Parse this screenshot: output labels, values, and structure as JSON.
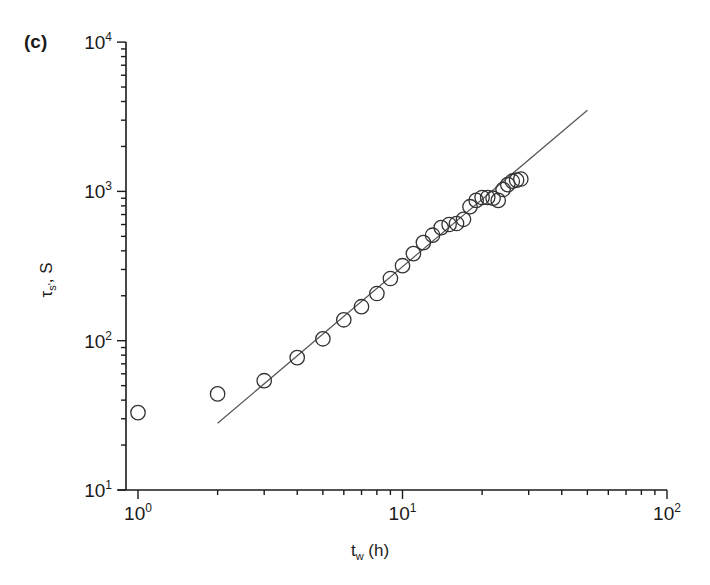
{
  "chart_data": {
    "type": "scatter",
    "panel_label": "(c)",
    "title": "",
    "xlabel": "t_w (h)",
    "xlabel_main": "t",
    "xlabel_sub": "w",
    "xlabel_rest": " (h)",
    "ylabel": "τ_s', S",
    "ylabel_main": "τ",
    "ylabel_sub": "s'",
    "ylabel_rest": ", S",
    "xscale": "log",
    "yscale": "log",
    "xlim": [
      1,
      100
    ],
    "ylim": [
      10,
      10000
    ],
    "grid": false,
    "legend": null,
    "x_ticks": [
      {
        "base": "10",
        "exp": "0",
        "value": 1
      },
      {
        "base": "10",
        "exp": "1",
        "value": 10
      },
      {
        "base": "10",
        "exp": "2",
        "value": 100
      }
    ],
    "y_ticks": [
      {
        "base": "10",
        "exp": "1",
        "value": 10
      },
      {
        "base": "10",
        "exp": "2",
        "value": 100
      },
      {
        "base": "10",
        "exp": "3",
        "value": 1000
      },
      {
        "base": "10",
        "exp": "4",
        "value": 10000
      }
    ],
    "series": [
      {
        "name": "measured",
        "marker": "open-circle",
        "x": [
          1,
          2,
          3,
          4,
          5,
          6,
          7,
          8,
          9,
          10,
          11,
          12,
          13,
          14,
          15,
          16,
          17,
          18,
          19,
          20,
          21,
          22,
          23,
          24,
          25,
          26,
          27,
          28
        ],
        "y": [
          33,
          44,
          54,
          77,
          103,
          138,
          169,
          207,
          261,
          318,
          383,
          454,
          509,
          572,
          600,
          610,
          650,
          790,
          870,
          910,
          910,
          900,
          870,
          1030,
          1110,
          1170,
          1190,
          1210
        ]
      },
      {
        "name": "power-law fit",
        "marker": "line",
        "x": [
          2,
          50
        ],
        "y": [
          28,
          3500
        ]
      }
    ]
  },
  "colors": {
    "ink": "#1a1a1a",
    "marker_stroke": "#333333",
    "fit_line": "#555555",
    "background": "#ffffff"
  }
}
